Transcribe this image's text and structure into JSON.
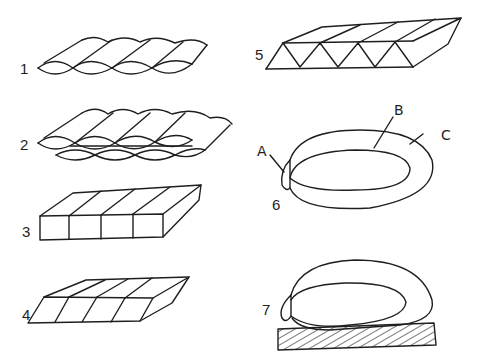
{
  "figures": [
    {
      "id": "1",
      "label": "1",
      "description": "single layer of rounded tube cells"
    },
    {
      "id": "2",
      "label": "2",
      "description": "double offset layer of rounded tube cells"
    },
    {
      "id": "3",
      "label": "3",
      "description": "rectangular box cells"
    },
    {
      "id": "4",
      "label": "4",
      "description": "sheared parallelogram box cells"
    },
    {
      "id": "5",
      "label": "5",
      "description": "triangular truss cells"
    },
    {
      "id": "6",
      "label": "6",
      "description": "ring/loop structure"
    },
    {
      "id": "7",
      "label": "7",
      "description": "ring/loop resting on hatched base"
    }
  ],
  "callouts": {
    "a": "A",
    "b": "B",
    "c": "C"
  },
  "colors": {
    "stroke": "#1e1e1e",
    "background": "#ffffff"
  }
}
